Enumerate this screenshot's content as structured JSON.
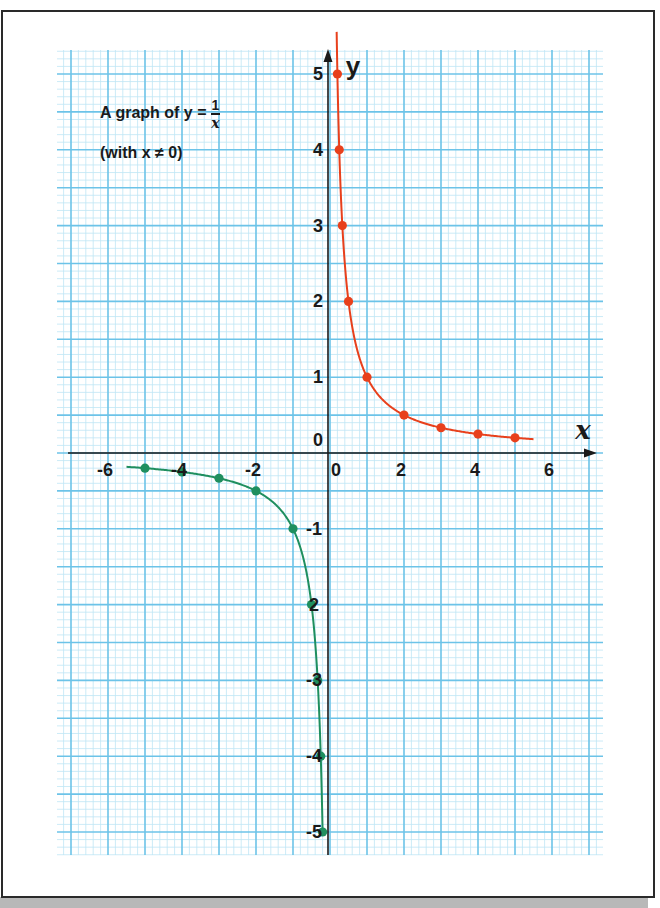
{
  "chart_data": {
    "type": "line",
    "subtitle": "(with x ≠ 0)",
    "title_parts": {
      "prefix": "A graph of y =",
      "numerator": "1",
      "denominator": "x"
    },
    "subtitle_text": "(with x ≠ 0)",
    "xlabel": "x",
    "ylabel": "y",
    "xlim": [
      -7,
      7
    ],
    "ylim": [
      -5,
      5
    ],
    "grid": true,
    "x_ticks": [
      {
        "value": -6,
        "label": "-6"
      },
      {
        "value": -4,
        "label": "-4"
      },
      {
        "value": -2,
        "label": "-2"
      },
      {
        "value": 0,
        "label": "0"
      },
      {
        "value": 2,
        "label": "2"
      },
      {
        "value": 4,
        "label": "4"
      },
      {
        "value": 6,
        "label": "6"
      }
    ],
    "y_ticks": [
      {
        "value": 5,
        "label": "5"
      },
      {
        "value": 4,
        "label": "4"
      },
      {
        "value": 3,
        "label": "3"
      },
      {
        "value": 2,
        "label": "2"
      },
      {
        "value": 1,
        "label": "1"
      },
      {
        "value": 0,
        "label": "0"
      },
      {
        "value": -1,
        "label": "-1"
      },
      {
        "value": -2,
        "label": "2"
      },
      {
        "value": -3,
        "label": "-3"
      },
      {
        "value": -4,
        "label": "-4"
      },
      {
        "value": -5,
        "label": "-5"
      }
    ],
    "series": [
      {
        "name": "y = 1/x (x > 0)",
        "color": "#e8401c",
        "x_range": [
          0.18,
          5.5
        ],
        "points": [
          {
            "x": 0.2,
            "y": 5
          },
          {
            "x": 0.25,
            "y": 4
          },
          {
            "x": 0.333,
            "y": 3
          },
          {
            "x": 0.5,
            "y": 2
          },
          {
            "x": 1,
            "y": 1
          },
          {
            "x": 2,
            "y": 0.5
          },
          {
            "x": 3,
            "y": 0.333
          },
          {
            "x": 4,
            "y": 0.25
          },
          {
            "x": 5,
            "y": 0.2
          }
        ]
      },
      {
        "name": "y = 1/x (x < 0)",
        "color": "#1f8f5f",
        "x_range": [
          -5.5,
          -0.2
        ],
        "points": [
          {
            "x": -5,
            "y": -0.2
          },
          {
            "x": -4,
            "y": -0.25
          },
          {
            "x": -3,
            "y": -0.333
          },
          {
            "x": -2,
            "y": -0.5
          },
          {
            "x": -1,
            "y": -1
          },
          {
            "x": -0.5,
            "y": -2
          },
          {
            "x": -0.333,
            "y": -3
          },
          {
            "x": -0.25,
            "y": -4
          },
          {
            "x": -0.2,
            "y": -5
          }
        ]
      }
    ],
    "colors": {
      "grid_major": "#6cc3e8",
      "grid_minor": "#bfe6f5",
      "axis": "#1a1a1a"
    }
  }
}
